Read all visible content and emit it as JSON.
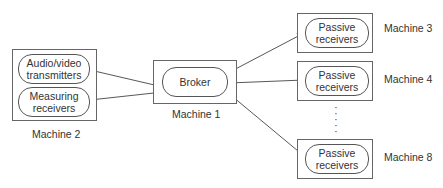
{
  "diagram": {
    "machines": [
      {
        "id": "m2",
        "label": "Machine 2",
        "components": [
          "Audio/video\ntransmitters",
          "Measuring\nreceivers"
        ]
      },
      {
        "id": "m1",
        "label": "Machine 1",
        "components": [
          "Broker"
        ]
      },
      {
        "id": "m3",
        "label": "Machine 3",
        "components": [
          "Passive\nreceivers"
        ]
      },
      {
        "id": "m4",
        "label": "Machine 4",
        "components": [
          "Passive\nreceivers"
        ]
      },
      {
        "id": "m8",
        "label": "Machine 8",
        "components": [
          "Passive\nreceivers"
        ]
      }
    ],
    "m2": {
      "label": "Machine 2",
      "av_line1": "Audio/video",
      "av_line2": "transmitters",
      "mr_line1": "Measuring",
      "mr_line2": "receivers"
    },
    "m1": {
      "label": "Machine 1",
      "broker": "Broker"
    },
    "m3": {
      "label": "Machine 3",
      "line1": "Passive",
      "line2": "receivers"
    },
    "m4": {
      "label": "Machine 4",
      "line1": "Passive",
      "line2": "receivers"
    },
    "m8": {
      "label": "Machine 8",
      "line1": "Passive",
      "line2": "receivers"
    },
    "ellipsis": "⋮",
    "connections": [
      {
        "from": "Broker",
        "to": "Audio/video transmitters",
        "bidirectional": true
      },
      {
        "from": "Broker",
        "to": "Measuring receivers",
        "bidirectional": true
      },
      {
        "from": "Broker",
        "to": "Passive receivers (Machine 3)",
        "bidirectional": true
      },
      {
        "from": "Broker",
        "to": "Passive receivers (Machine 4)",
        "bidirectional": true
      },
      {
        "from": "Broker",
        "to": "Passive receivers (Machine 8)",
        "bidirectional": true
      }
    ]
  }
}
